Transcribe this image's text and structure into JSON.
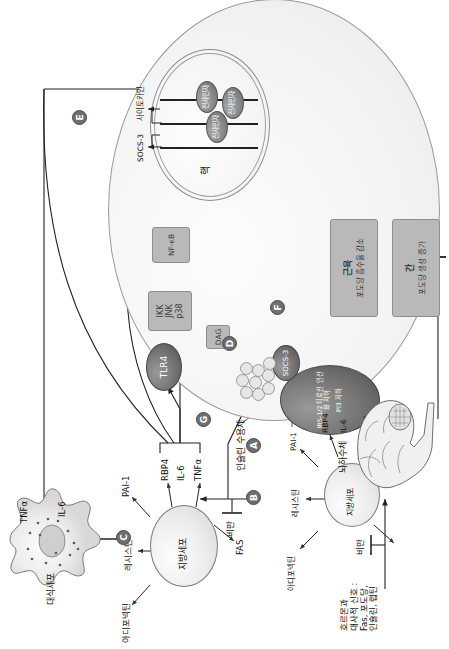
{
  "figure": {
    "orientation": "rotated-90-ccw",
    "language": "ko",
    "background": "#ffffff",
    "accent_gray": "#6f6f6f"
  },
  "hormone_note": {
    "line1": "호르몬과",
    "line2": "대사적 신호 :",
    "line3": "Fas, 포도당,",
    "line4": "인슐린, 렙틴"
  },
  "obesity_labels": {
    "brain_arrow": "비만",
    "adipocyte_arrow": "비만"
  },
  "brain": {
    "label": "뇌하수체"
  },
  "macrophage": {
    "name": "대식세포",
    "secretions": [
      "TNFα",
      "IL-6"
    ]
  },
  "adipocyte_lean": {
    "name": "지방세포",
    "secretions": [
      "아디포넥틴",
      "레시스틴",
      "PAI-1",
      "RBP4",
      "TNFα",
      "IL-6",
      "FAS"
    ]
  },
  "adipocyte_obese": {
    "name": "지방세포",
    "secretions": [
      "아디포넥틴",
      "레시스틴",
      "PAI-1",
      "RBP4",
      "TNFα",
      "IL-6",
      "FAS"
    ]
  },
  "target_cell": {
    "insulin_receptor_label": "인슐린 수용체",
    "irs": {
      "line1": "IRS-1/2 티로신 인산화 저하",
      "line2": "PI3 저하"
    },
    "socs3_cyto": "SOCS-3",
    "lipid_droplets_label": "",
    "dag": "DAG",
    "pkc": "PKC",
    "tlr4": "TLR4",
    "kinases": "IKK\nJNK\np38",
    "kinase_lines": [
      "IKK",
      "JNK",
      "p38"
    ],
    "nfkb": "NF-κB"
  },
  "nucleus": {
    "label": "핵",
    "gene_socs3": "SOCS-3",
    "gene_cytokine": "사이토카인",
    "factors": [
      "전사인자",
      "전사인자",
      "전사인자"
    ]
  },
  "outcomes": [
    {
      "organ": "근육",
      "effect": "포도당 흡수율 감소"
    },
    {
      "organ": "간",
      "effect": "포도당 생성 증가"
    }
  ],
  "tags": [
    {
      "id": "A",
      "letter": "A"
    },
    {
      "id": "B",
      "letter": "B"
    },
    {
      "id": "C",
      "letter": "C"
    },
    {
      "id": "D",
      "letter": "D"
    },
    {
      "id": "E",
      "letter": "E"
    },
    {
      "id": "F",
      "letter": "F"
    },
    {
      "id": "G",
      "letter": "G"
    },
    {
      "id": "H",
      "letter": "H"
    }
  ]
}
